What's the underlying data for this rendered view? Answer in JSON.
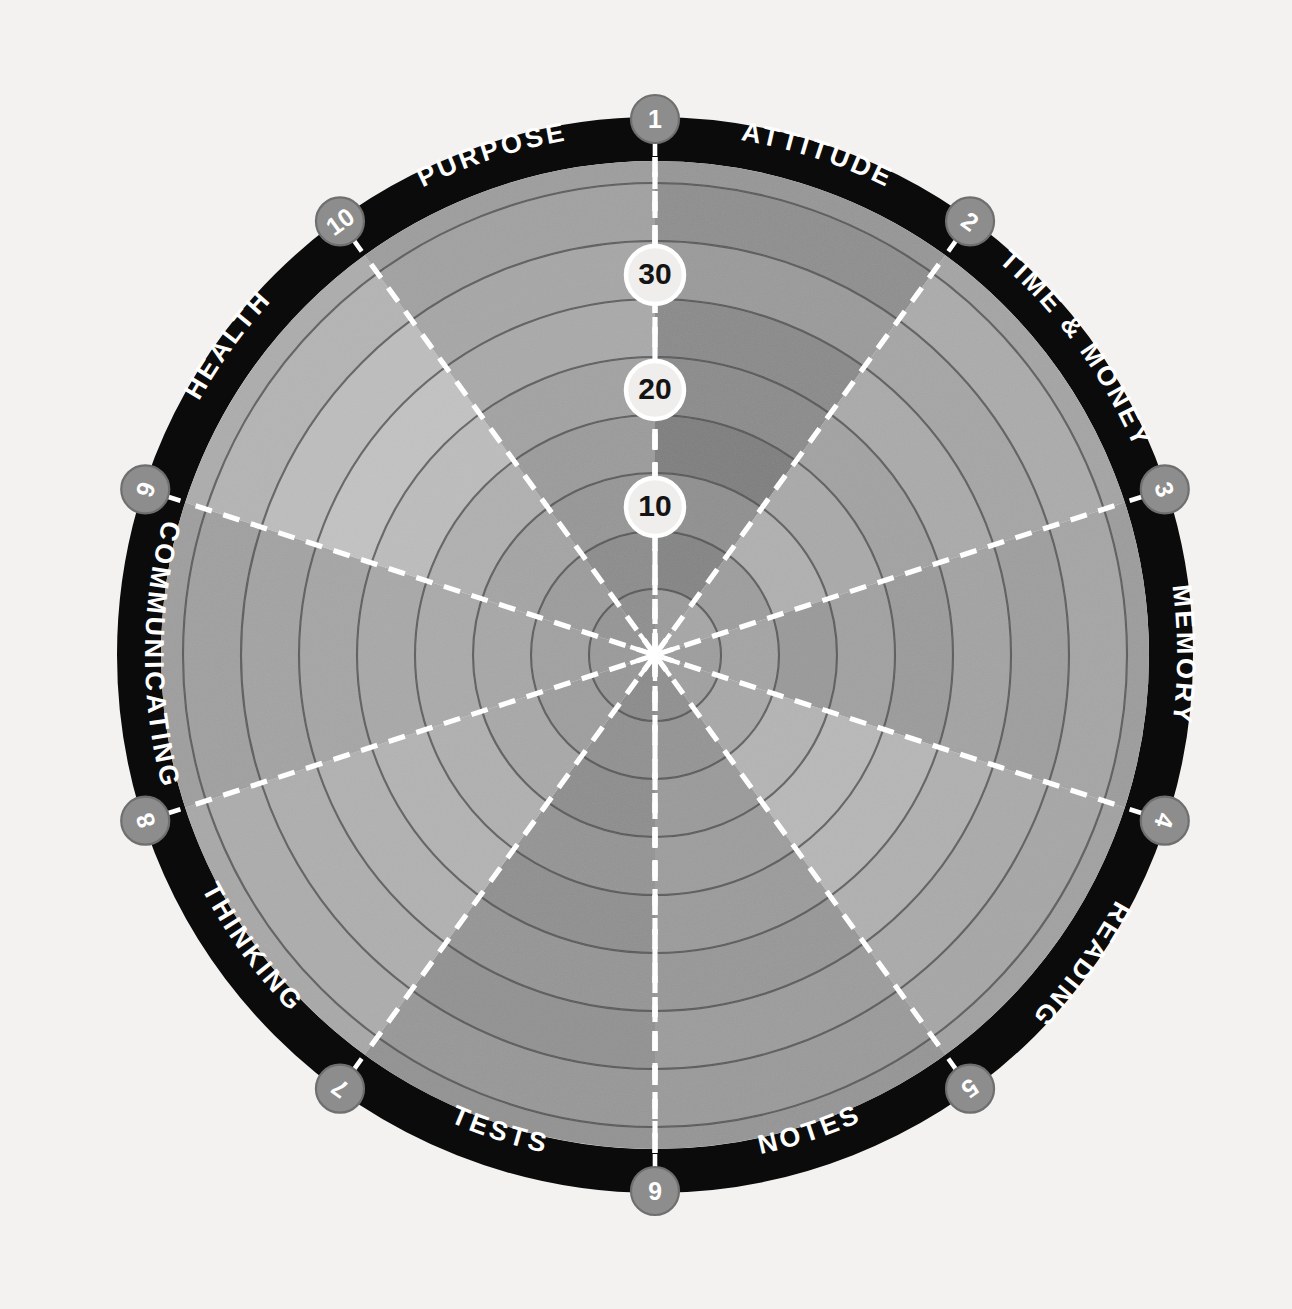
{
  "chart_data": {
    "type": "pie",
    "subtype": "radial-segment-wheel",
    "center": {
      "x": 655,
      "y": 655
    },
    "outer_radius": 538,
    "band_thickness": 44,
    "ring_count": 9,
    "ring_radii": [
      66,
      124,
      182,
      240,
      298,
      356,
      414,
      472,
      538
    ],
    "scale_min": 0,
    "scale_max": 40,
    "scale_labels": [
      {
        "value": "10",
        "radius": 148
      },
      {
        "value": "20",
        "radius": 265
      },
      {
        "value": "30",
        "radius": 380
      }
    ],
    "wedge_count": 10,
    "wedge_span_degrees": 36,
    "background_color": "#f3f2f0",
    "band_color": "#0b0b0b",
    "divider_color": "#ffffff",
    "ring_line_color": "#4b4b4b",
    "badge_fill": "#8d8d8d",
    "badge_stroke": "#6f6f6f",
    "badge_text_color": "#ffffff",
    "categories": [
      {
        "index": 1,
        "label": "ATTITUDE",
        "badge": "1",
        "start_deg": 0,
        "end_deg": 36,
        "flip": false,
        "ring_shades": [
          "#9b9b9b",
          "#848484",
          "#8f8f8f",
          "#7e7e7e",
          "#8b8b8b",
          "#8a8a8a",
          "#9a9a9a",
          "#8e8e8e",
          "#969696"
        ]
      },
      {
        "index": 2,
        "label": "TIME & MONEY",
        "badge": "2",
        "start_deg": 36,
        "end_deg": 72,
        "flip": false,
        "ring_shades": [
          "#a6a6a6",
          "#9d9d9d",
          "#b0b0b0",
          "#a9a9a9",
          "#a2a2a2",
          "#aaaaaa",
          "#a5a5a5",
          "#ababab",
          "#a4a4a4"
        ]
      },
      {
        "index": 3,
        "label": "MEMORY",
        "badge": "3",
        "start_deg": 72,
        "end_deg": 108,
        "flip": false,
        "ring_shades": [
          "#9d9d9d",
          "#a4a4a4",
          "#999999",
          "#a1a1a1",
          "#9b9b9b",
          "#a3a3a3",
          "#9e9e9e",
          "#a5a5a5",
          "#9c9c9c"
        ]
      },
      {
        "index": 4,
        "label": "READING",
        "badge": "4",
        "start_deg": 108,
        "end_deg": 144,
        "flip": false,
        "ring_shades": [
          "#a0a0a0",
          "#a8a8a8",
          "#b4b4b4",
          "#b8b8b8",
          "#b6b6b6",
          "#b0b0b0",
          "#aaaaaa",
          "#a6a6a6",
          "#a1a1a1"
        ]
      },
      {
        "index": 5,
        "label": "NOTES",
        "badge": "5",
        "start_deg": 144,
        "end_deg": 180,
        "flip": true,
        "ring_shades": [
          "#8f8f8f",
          "#949494",
          "#9a9a9a",
          "#9d9d9d",
          "#9b9b9b",
          "#979797",
          "#9c9c9c",
          "#9a9a9a",
          "#959595"
        ]
      },
      {
        "index": 6,
        "label": "TESTS",
        "badge": "6",
        "start_deg": 180,
        "end_deg": 216,
        "flip": true,
        "ring_shades": [
          "#8b8b8b",
          "#909090",
          "#8d8d8d",
          "#949494",
          "#8f8f8f",
          "#959595",
          "#919191",
          "#979797",
          "#929292"
        ]
      },
      {
        "index": 7,
        "label": "THINKING",
        "badge": "7",
        "start_deg": 216,
        "end_deg": 252,
        "flip": true,
        "ring_shades": [
          "#979797",
          "#9e9e9e",
          "#a8a8a8",
          "#b0b0b0",
          "#b3b3b3",
          "#b1b1b1",
          "#aeaeae",
          "#acacac",
          "#a8a8a8"
        ]
      },
      {
        "index": 8,
        "label": "COMMUNICATING",
        "badge": "8",
        "start_deg": 252,
        "end_deg": 288,
        "flip": true,
        "ring_shades": [
          "#9a9a9a",
          "#a1a1a1",
          "#a7a7a7",
          "#aaaaaa",
          "#a8a8a8",
          "#a5a5a5",
          "#a3a3a3",
          "#a0a0a0",
          "#9e9e9e"
        ]
      },
      {
        "index": 9,
        "label": "HEALTH",
        "badge": "9",
        "start_deg": 288,
        "end_deg": 324,
        "flip": false,
        "ring_shades": [
          "#959595",
          "#9c9c9c",
          "#a4a4a4",
          "#b0b0b0",
          "#bcbcbc",
          "#c2c2c2",
          "#bdbdbd",
          "#b4b4b4",
          "#acacac"
        ]
      },
      {
        "index": 10,
        "label": "PURPOSE",
        "badge": "10",
        "start_deg": 324,
        "end_deg": 360,
        "flip": false,
        "ring_shades": [
          "#8e8e8e",
          "#8c8c8c",
          "#969696",
          "#9b9b9b",
          "#a2a2a2",
          "#a9a9a9",
          "#a6a6a6",
          "#a1a1a1",
          "#9d9d9d"
        ]
      }
    ]
  }
}
